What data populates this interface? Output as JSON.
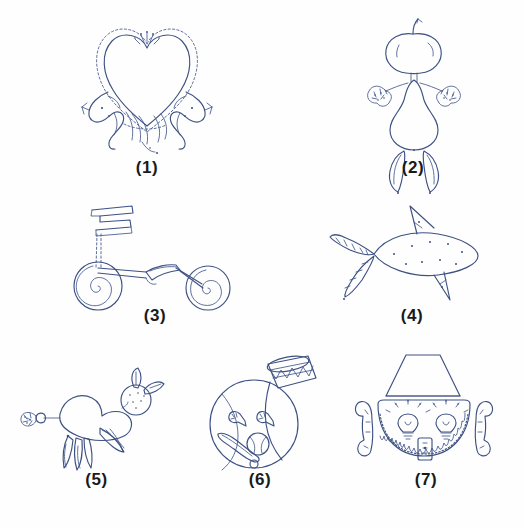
{
  "figure": {
    "background_color": "#fefefe",
    "ink_color": "#3d5183",
    "label_color": "#1a1a1a",
    "bottom_caption": "",
    "rows": 3,
    "panel_count": 7,
    "panels": [
      {
        "number": 1,
        "label": "(1)",
        "subject": "heart shape formed by two facing animal figures",
        "description": "Large dotted heart outline resting on a pair of mirrored creature bodies at the base",
        "x": 62,
        "y": 12,
        "w": 170,
        "h": 178,
        "label_y": 158
      },
      {
        "number": 2,
        "label": "(2)",
        "subject": "standing figure built from fruit and vegetables",
        "description": "Apple head with stem, pear body, broccoli hands on both sides, two banana legs",
        "x": 338,
        "y": 12,
        "w": 150,
        "h": 178,
        "label_y": 158
      },
      {
        "number": 3,
        "label": "(3)",
        "subject": "scooter with spiral wheels",
        "description": "Side view of a kick scooter: zig-zag handlebar, straight stem, flat deck, two concentric-spiral wheels",
        "x": 60,
        "y": 192,
        "w": 190,
        "h": 150,
        "label_y": 308
      },
      {
        "number": 4,
        "label": "(4)",
        "subject": "fish with leafy tail and pointed fins",
        "description": "Oval speckled body with a dorsal fin, lower fin and a leafy asparagus-like tail at the left",
        "x": 322,
        "y": 192,
        "w": 180,
        "h": 150,
        "label_y": 308
      },
      {
        "number": 5,
        "label": "(5)",
        "subject": "bird-like creature made from produce",
        "description": "Round speckled head with leaf ears, a large bulbous body, a crest sprout at the beak and banana tail feathers",
        "x": 14,
        "y": 368,
        "w": 165,
        "h": 140,
        "label_y": 478
      },
      {
        "number": 6,
        "label": "(6)",
        "subject": "face made of a baseball with a drum hat",
        "description": "Baseball head with stitching, a snare drum as a hat, whistle eyes, and a bat with a ball forming the mouth",
        "x": 196,
        "y": 352,
        "w": 128,
        "h": 156,
        "label_y": 478
      },
      {
        "number": 7,
        "label": "(7)",
        "subject": "face made of household objects",
        "description": "Lampshade hat, telephone handsets as ears, two light bulbs as eyes, a light switch as a nose and a coiled cord smile",
        "x": 340,
        "y": 352,
        "w": 172,
        "h": 156,
        "label_y": 478
      }
    ]
  }
}
